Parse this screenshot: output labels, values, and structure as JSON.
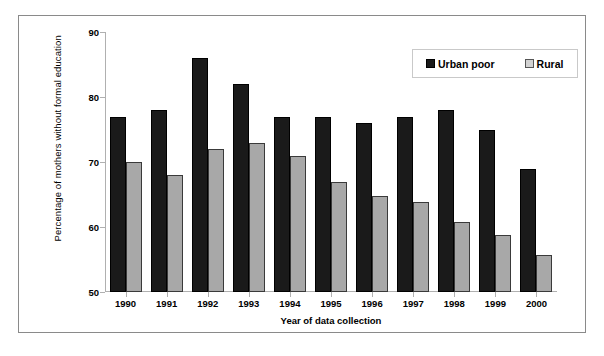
{
  "chart_data": {
    "type": "bar",
    "title": "",
    "xlabel": "Year of data collection",
    "ylabel": "Percentage of mothers without formal education",
    "ylim": [
      50,
      90
    ],
    "yticks": [
      50,
      60,
      70,
      80,
      90
    ],
    "grid": false,
    "legend_position": "top-right",
    "categories": [
      "1990",
      "1991",
      "1992",
      "1993",
      "1994",
      "1995",
      "1996",
      "1997",
      "1998",
      "1999",
      "2000"
    ],
    "series": [
      {
        "name": "Urban poor",
        "color": "#1a1a1a",
        "values": [
          77,
          78,
          86,
          82,
          77,
          77,
          76,
          77,
          78,
          75,
          69
        ]
      },
      {
        "name": "Rural",
        "color": "#a8a8a8",
        "values": [
          70,
          68,
          72,
          73,
          71,
          67,
          64.7,
          63.8,
          60.8,
          58.7,
          55.7
        ]
      }
    ]
  },
  "legend": {
    "entries": [
      {
        "label": "Urban poor",
        "swatch": "urban-poor-swatch"
      },
      {
        "label": "Rural",
        "swatch": "rural-swatch"
      }
    ]
  },
  "axes": {
    "y_title": "Percentage of mothers without formal education",
    "x_title": "Year of data collection",
    "y_tick_labels": [
      "90",
      "80",
      "70",
      "60",
      "50"
    ],
    "x_tick_labels": [
      "1990",
      "1991",
      "1992",
      "1993",
      "1994",
      "1995",
      "1996",
      "1997",
      "1998",
      "1999",
      "2000"
    ]
  }
}
